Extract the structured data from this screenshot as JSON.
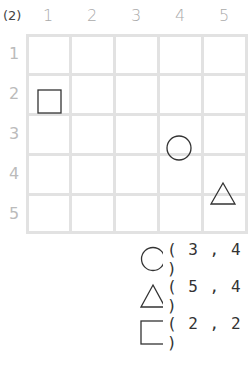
{
  "question_label": "(2)",
  "columns": [
    "1",
    "2",
    "3",
    "4",
    "5"
  ],
  "rows": [
    "1",
    "2",
    "3",
    "4",
    "5"
  ],
  "grid_shapes": [
    {
      "shape": "square",
      "col": 1,
      "row": 2
    },
    {
      "shape": "circle",
      "col": 4,
      "row": 3
    },
    {
      "shape": "triangle",
      "col": 5,
      "row": 4
    }
  ],
  "legend": [
    {
      "shape": "circle",
      "text": "( 3 , 4 )"
    },
    {
      "shape": "triangle",
      "text": "( 5 , 4 )"
    },
    {
      "shape": "square",
      "text": "( 2 , 2 )"
    }
  ],
  "colors": {
    "grid": "#e2e2e2",
    "shape_stroke": "#333333",
    "header_text": "#aaaaaa"
  }
}
